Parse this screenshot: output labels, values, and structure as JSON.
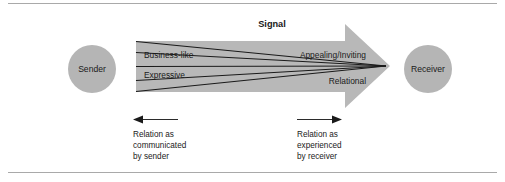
{
  "figure": {
    "title_label": "Signal",
    "sender_label": "Sender",
    "receiver_label": "Receiver",
    "bands": {
      "sender_side": [
        "Business-like",
        "Expressive"
      ],
      "receiver_side": [
        "Appealing/Inviting",
        "Relational"
      ]
    },
    "annotations": {
      "left": {
        "arrow_direction": "left",
        "lines": [
          "Relation as",
          "communicated",
          "by sender"
        ]
      },
      "right": {
        "arrow_direction": "right",
        "lines": [
          "Relation as",
          "experienced",
          "by receiver"
        ]
      }
    },
    "colors": {
      "background": "#ffffff",
      "shape_gray": "#b5b5b5",
      "arrow_gray": "#b8b8b8",
      "rule_gray": "#a9a9a9",
      "text": "#1a1a1a"
    }
  }
}
